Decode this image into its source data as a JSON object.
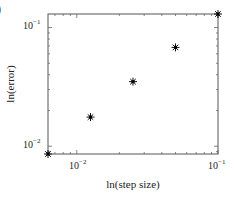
{
  "figure": {
    "corner_label": ")"
  },
  "chart_data": {
    "type": "scatter",
    "title": "",
    "xlabel": "ln(step size)",
    "ylabel": "ln(error)",
    "xscale": "log",
    "yscale": "log",
    "xlim": [
      0.00625,
      0.1
    ],
    "ylim": [
      0.0086,
      0.13
    ],
    "grid": false,
    "legend": null,
    "marker": "*",
    "x_ticks": [
      {
        "value": 0.01,
        "label_base": "10",
        "label_exp": "−2"
      },
      {
        "value": 0.1,
        "label_base": "10",
        "label_exp": "−1"
      }
    ],
    "y_ticks": [
      {
        "value": 0.01,
        "label_base": "10",
        "label_exp": "−2"
      },
      {
        "value": 0.1,
        "label_base": "10",
        "label_exp": "−1"
      }
    ],
    "series": [
      {
        "name": "error vs step size",
        "x": [
          0.00625,
          0.0125,
          0.025,
          0.05,
          0.1
        ],
        "y": [
          0.0086,
          0.0176,
          0.035,
          0.068,
          0.13
        ]
      }
    ]
  }
}
